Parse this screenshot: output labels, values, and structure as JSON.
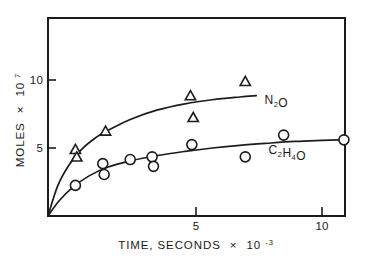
{
  "chart_data": {
    "type": "scatter",
    "title": "",
    "subtitle": "",
    "xlabel": "TIME, SECONDS × 10⁻³",
    "ylabel": "MOLES × 10⁷",
    "xlim": [
      0,
      11.6
    ],
    "ylim": [
      0,
      14.6
    ],
    "grid": false,
    "legend_position": "inline-right",
    "xticks": [
      5,
      10
    ],
    "xtick_labels": [
      "5",
      "10"
    ],
    "yticks": [
      5,
      10
    ],
    "ytick_labels": [
      "5",
      "10"
    ],
    "series": [
      {
        "name": "N2O",
        "label_text": "N",
        "label_sub": "2",
        "label_tail": "O",
        "marker": "triangle",
        "label_x": 7.9,
        "label_y": 8.2,
        "points": [
          {
            "x": 1.0,
            "y": 4.85
          },
          {
            "x": 1.05,
            "y": 4.3
          },
          {
            "x": 2.1,
            "y": 6.2
          },
          {
            "x": 5.2,
            "y": 8.8
          },
          {
            "x": 5.3,
            "y": 7.2
          },
          {
            "x": 7.2,
            "y": 9.85
          }
        ],
        "curve": [
          {
            "x": 0.0,
            "y": 0.0
          },
          {
            "x": 0.35,
            "y": 2.2
          },
          {
            "x": 0.75,
            "y": 3.7
          },
          {
            "x": 1.2,
            "y": 4.85
          },
          {
            "x": 1.7,
            "y": 5.7
          },
          {
            "x": 2.2,
            "y": 6.3
          },
          {
            "x": 3.0,
            "y": 7.1
          },
          {
            "x": 4.0,
            "y": 7.8
          },
          {
            "x": 5.0,
            "y": 8.25
          },
          {
            "x": 6.0,
            "y": 8.55
          },
          {
            "x": 7.0,
            "y": 8.75
          },
          {
            "x": 7.6,
            "y": 8.85
          }
        ]
      },
      {
        "name": "C2H4O",
        "label_text": "C",
        "label_sub": "2",
        "label_mid": "H",
        "label_sub2": "4",
        "label_tail": "O",
        "marker": "circle",
        "label_x": 8.05,
        "label_y": 4.55,
        "points": [
          {
            "x": 1.0,
            "y": 2.25
          },
          {
            "x": 2.0,
            "y": 3.85
          },
          {
            "x": 2.05,
            "y": 3.05
          },
          {
            "x": 3.0,
            "y": 4.15
          },
          {
            "x": 3.8,
            "y": 4.35
          },
          {
            "x": 3.85,
            "y": 3.65
          },
          {
            "x": 5.25,
            "y": 5.25
          },
          {
            "x": 7.2,
            "y": 4.35
          },
          {
            "x": 8.6,
            "y": 5.95
          },
          {
            "x": 10.8,
            "y": 5.6
          }
        ],
        "curve": [
          {
            "x": 0.0,
            "y": 0.0
          },
          {
            "x": 0.4,
            "y": 1.1
          },
          {
            "x": 0.9,
            "y": 2.1
          },
          {
            "x": 1.5,
            "y": 2.95
          },
          {
            "x": 2.2,
            "y": 3.6
          },
          {
            "x": 3.0,
            "y": 4.05
          },
          {
            "x": 4.0,
            "y": 4.45
          },
          {
            "x": 5.0,
            "y": 4.75
          },
          {
            "x": 6.0,
            "y": 5.0
          },
          {
            "x": 7.0,
            "y": 5.2
          },
          {
            "x": 8.0,
            "y": 5.35
          },
          {
            "x": 9.0,
            "y": 5.48
          },
          {
            "x": 10.0,
            "y": 5.56
          },
          {
            "x": 10.9,
            "y": 5.62
          }
        ]
      }
    ]
  },
  "axis": {
    "y_title_main": "MOLES",
    "y_title_times": "×",
    "y_title_base": "10",
    "y_title_exp": "7",
    "x_title_main": "TIME, SECONDS",
    "x_title_times": "×",
    "x_title_base": "10",
    "x_title_exp": "-3"
  }
}
